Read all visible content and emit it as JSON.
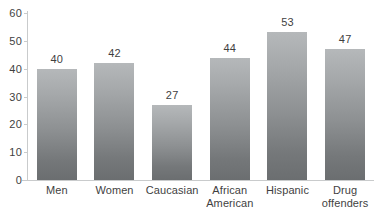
{
  "chart_data": {
    "type": "bar",
    "title": "",
    "subtitle": "",
    "xlabel": "",
    "ylabel": "",
    "ylim": [
      0,
      60
    ],
    "yticks": [
      0,
      10,
      20,
      30,
      40,
      50,
      60
    ],
    "ytick_labels": [
      "0",
      "10",
      "20",
      "30",
      "40",
      "50",
      "60"
    ],
    "grid": false,
    "legend": false,
    "legend_position": "none",
    "categories": [
      "Men",
      "Women",
      "Caucasian",
      "African American",
      "Hispanic",
      "Drug offenders"
    ],
    "category_lines": [
      [
        "Men"
      ],
      [
        "Women"
      ],
      [
        "Caucasian"
      ],
      [
        "African",
        "American"
      ],
      [
        "Hispanic"
      ],
      [
        "Drug",
        "offenders"
      ]
    ],
    "values": [
      40,
      42,
      27,
      44,
      53,
      47
    ],
    "data_labels": [
      "40",
      "42",
      "27",
      "44",
      "53",
      "47"
    ],
    "bar_color_top": "#b5b8ba",
    "bar_color_bottom": "#6b6e70",
    "axis_color": "#c9cbcc",
    "text_color": "#3f3f3f",
    "background_color": "#ffffff"
  }
}
